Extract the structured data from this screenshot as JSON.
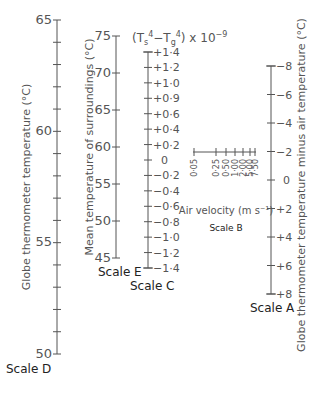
{
  "diagram": {
    "type": "nomogram",
    "formula_label": {
      "base": "(T",
      "s_sub": "s",
      "sup4a": "4",
      "minus": "−T",
      "g_sub": "g",
      "sup4b": "4",
      "tail": ") x 10",
      "exp": "−9"
    },
    "scales": {
      "D": {
        "name": "Scale D",
        "title": "Globe thermometer temperature (°C)",
        "labels": [
          "65",
          "60",
          "55",
          "50"
        ],
        "range": [
          50,
          65
        ]
      },
      "E": {
        "name": "Scale E",
        "title": "Mean temperature of surroundings (°C)",
        "labels": [
          "75",
          "70",
          "65",
          "60",
          "55",
          "50",
          "45"
        ],
        "range": [
          45,
          75
        ]
      },
      "C": {
        "name": "Scale C",
        "labels": [
          "+1·4",
          "+1·2",
          "+1·0",
          "+0·9",
          "+0·6",
          "+0·4",
          "+0·2",
          "0",
          "−0·2",
          "−0·4",
          "−0·6",
          "−0·8",
          "−1·0",
          "−1·2",
          "−1·4"
        ]
      },
      "B": {
        "name": "Scale B",
        "title": "Air velocity (m s⁻¹)",
        "labels": [
          "0·05",
          "0·25",
          "0·50",
          "1·00",
          "2·00",
          "5·00",
          "7·50"
        ]
      },
      "A": {
        "name": "Scale A",
        "title": "Globe thermometer temperature minus air temperature (°C)",
        "labels": [
          "−8",
          "−6",
          "−4",
          "−2",
          "0",
          "+2",
          "+4",
          "+6",
          "+8"
        ],
        "range": [
          -8,
          8
        ]
      }
    }
  }
}
